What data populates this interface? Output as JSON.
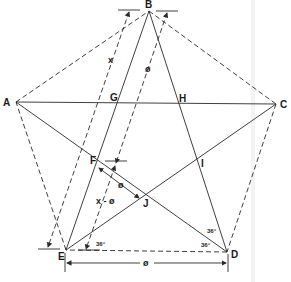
{
  "figure": {
    "type": "regular-pentagon-with-pentagram",
    "vertices": {
      "A": {
        "label": "A",
        "x": 16,
        "y": 102
      },
      "B": {
        "label": "B",
        "x": 149,
        "y": 11
      },
      "C": {
        "label": "C",
        "x": 276,
        "y": 104
      },
      "D": {
        "label": "D",
        "x": 227,
        "y": 252
      },
      "E": {
        "label": "E",
        "x": 66,
        "y": 250
      }
    },
    "intersections": {
      "F": {
        "label": "F",
        "x": 97,
        "y": 163
      },
      "G": {
        "label": "G",
        "x": 113,
        "y": 103
      },
      "H": {
        "label": "H",
        "x": 179,
        "y": 104
      },
      "I": {
        "label": "I",
        "x": 200,
        "y": 163
      },
      "J": {
        "label": "J",
        "x": 145,
        "y": 199
      }
    },
    "dimension_labels": {
      "x": "x",
      "phi_top": "ø",
      "x_minus_phi": "x - ø",
      "phi_fj": "ø",
      "phi_ed": "ø"
    },
    "angle_labels": {
      "angle_e": "36°",
      "angle_d_upper": "36°",
      "angle_d_lower": "36°"
    },
    "edge_style": "dashed",
    "diagonal_style": "solid",
    "line_color": "#2a2a2a"
  }
}
